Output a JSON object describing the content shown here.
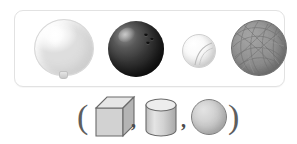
{
  "page": {
    "background_color": "#ffffff"
  },
  "objects_panel": {
    "name": "real-world-objects-panel",
    "border_color": "#e2e2e2",
    "background_color": "#ffffff",
    "items": [
      {
        "id": "balloon",
        "label": "balloon",
        "icon": "balloon-icon",
        "color": "#f0f0f0",
        "outline_color": "#d8d8d8",
        "matches_solid": "sphere"
      },
      {
        "id": "bowling-ball",
        "label": "bowling ball",
        "icon": "bowling-ball-icon",
        "color": "#343434",
        "outline_color": "#151515",
        "matches_solid": "sphere",
        "finger_holes": 3
      },
      {
        "id": "small-ball",
        "label": "small ball",
        "icon": "ball-icon",
        "color": "#ececec",
        "outline_color": "#cfcfcf",
        "matches_solid": "sphere"
      },
      {
        "id": "yarn-ball",
        "label": "ball of yarn",
        "icon": "yarn-ball-icon",
        "color": "#8a8a8a",
        "outline_color": "#6c6c6c",
        "matches_solid": "sphere"
      }
    ]
  },
  "answer_row": {
    "name": "solid-shape-choices",
    "open_paren": "(",
    "close_paren": ")",
    "separator": ",",
    "choices": [
      {
        "id": "cube",
        "label": "cube",
        "icon": "cube-icon",
        "fill_color": "#d0d0d0",
        "outline_color": "#6a6a6a",
        "selected": false
      },
      {
        "id": "cylinder",
        "label": "cylinder",
        "icon": "cylinder-icon",
        "fill_color": "#cfcfcf",
        "outline_color": "#6a6a6a",
        "selected": false
      },
      {
        "id": "sphere",
        "label": "sphere",
        "icon": "sphere-icon",
        "fill_color": "#c2c2c2",
        "outline_color": "#7d7d7d",
        "selected": false
      }
    ]
  }
}
